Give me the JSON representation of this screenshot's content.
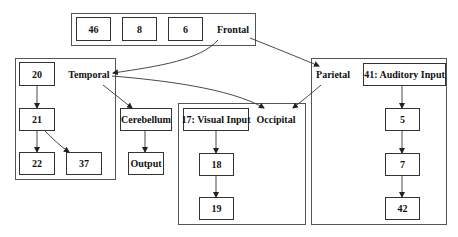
{
  "diagram": {
    "clusters": {
      "frontal": {
        "label": "Frontal",
        "nodes": [
          "46",
          "8",
          "6"
        ]
      },
      "temporal": {
        "label": "Temporal",
        "nodes": [
          "20",
          "21",
          "22",
          "37"
        ]
      },
      "occipital": {
        "label": "Occipital",
        "nodes": [
          "17: Visual Input",
          "18",
          "19"
        ]
      },
      "parietal": {
        "label": "Parietal",
        "nodes": [
          "41: Auditory Input",
          "5",
          "7",
          "42"
        ]
      }
    },
    "standalone": {
      "cerebellum": "Cerebellum",
      "output": "Output"
    },
    "edges": [
      [
        "Frontal",
        "Temporal"
      ],
      [
        "Frontal",
        "Parietal"
      ],
      [
        "Temporal",
        "Occipital"
      ],
      [
        "Temporal",
        "Cerebellum"
      ],
      [
        "Parietal",
        "Occipital"
      ],
      [
        "20",
        "21"
      ],
      [
        "21",
        "22"
      ],
      [
        "21",
        "37"
      ],
      [
        "Cerebellum",
        "Output"
      ],
      [
        "17: Visual Input",
        "18"
      ],
      [
        "18",
        "19"
      ],
      [
        "41: Auditory Input",
        "5"
      ],
      [
        "5",
        "7"
      ],
      [
        "7",
        "42"
      ]
    ],
    "colors": {
      "line": "#333333",
      "background": "#ffffff"
    }
  }
}
